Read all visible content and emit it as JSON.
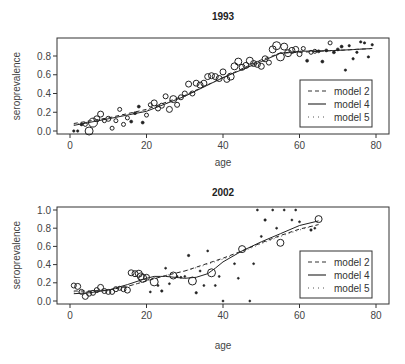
{
  "chart_data": [
    {
      "type": "scatter",
      "title": "1993",
      "xlabel": "age",
      "ylabel": "seroprevalence",
      "xlim": [
        -4,
        83
      ],
      "ylim": [
        -0.04,
        0.97
      ],
      "xticks": [
        0,
        20,
        40,
        60,
        80
      ],
      "yticks": [
        0.0,
        0.2,
        0.4,
        0.6,
        0.8
      ],
      "ytick_labels": [
        "0.0",
        "0.2",
        "0.4",
        "0.6",
        "0.8"
      ],
      "grid": false,
      "legend": {
        "position": "lower right",
        "entries": [
          {
            "label": "model 2",
            "style": "dashed"
          },
          {
            "label": "model 4",
            "style": "solid"
          },
          {
            "label": "model 5",
            "style": "dotted"
          }
        ]
      },
      "points": [
        {
          "x": 1,
          "y": 0.0,
          "r": 1.2
        },
        {
          "x": 2,
          "y": 0.0,
          "r": 1.2
        },
        {
          "x": 3,
          "y": 0.07,
          "r": 1.5
        },
        {
          "x": 4,
          "y": 0.07,
          "r": 2
        },
        {
          "x": 5,
          "y": 0.0,
          "r": 4
        },
        {
          "x": 6,
          "y": 0.09,
          "r": 4.5
        },
        {
          "x": 7,
          "y": 0.13,
          "r": 3
        },
        {
          "x": 8,
          "y": 0.18,
          "r": 3
        },
        {
          "x": 9,
          "y": 0.11,
          "r": 2
        },
        {
          "x": 10,
          "y": 0.13,
          "r": 2.5
        },
        {
          "x": 11,
          "y": 0.03,
          "r": 2
        },
        {
          "x": 12,
          "y": 0.11,
          "r": 2
        },
        {
          "x": 13,
          "y": 0.23,
          "r": 2
        },
        {
          "x": 14,
          "y": 0.07,
          "r": 2
        },
        {
          "x": 15,
          "y": 0.14,
          "r": 2
        },
        {
          "x": 16,
          "y": 0.1,
          "r": 1.5
        },
        {
          "x": 17,
          "y": 0.19,
          "r": 1.5
        },
        {
          "x": 18,
          "y": 0.26,
          "r": 1.5
        },
        {
          "x": 19,
          "y": 0.09,
          "r": 1.5
        },
        {
          "x": 20,
          "y": 0.17,
          "r": 2
        },
        {
          "x": 21,
          "y": 0.28,
          "r": 2
        },
        {
          "x": 22,
          "y": 0.3,
          "r": 3
        },
        {
          "x": 23,
          "y": 0.24,
          "r": 2.5
        },
        {
          "x": 24,
          "y": 0.27,
          "r": 2.5
        },
        {
          "x": 25,
          "y": 0.37,
          "r": 2.5
        },
        {
          "x": 26,
          "y": 0.23,
          "r": 3
        },
        {
          "x": 27,
          "y": 0.34,
          "r": 3.5
        },
        {
          "x": 28,
          "y": 0.28,
          "r": 2.5
        },
        {
          "x": 29,
          "y": 0.36,
          "r": 2.5
        },
        {
          "x": 30,
          "y": 0.4,
          "r": 2.5
        },
        {
          "x": 31,
          "y": 0.5,
          "r": 3
        },
        {
          "x": 32,
          "y": 0.4,
          "r": 2.5
        },
        {
          "x": 33,
          "y": 0.51,
          "r": 3
        },
        {
          "x": 34,
          "y": 0.49,
          "r": 3
        },
        {
          "x": 35,
          "y": 0.51,
          "r": 3
        },
        {
          "x": 36,
          "y": 0.58,
          "r": 3
        },
        {
          "x": 37,
          "y": 0.59,
          "r": 3
        },
        {
          "x": 38,
          "y": 0.58,
          "r": 3
        },
        {
          "x": 39,
          "y": 0.56,
          "r": 3
        },
        {
          "x": 40,
          "y": 0.63,
          "r": 3
        },
        {
          "x": 41,
          "y": 0.55,
          "r": 3
        },
        {
          "x": 42,
          "y": 0.58,
          "r": 3.5
        },
        {
          "x": 43,
          "y": 0.69,
          "r": 3.5
        },
        {
          "x": 44,
          "y": 0.74,
          "r": 3.5
        },
        {
          "x": 45,
          "y": 0.68,
          "r": 3
        },
        {
          "x": 46,
          "y": 0.7,
          "r": 3
        },
        {
          "x": 47,
          "y": 0.75,
          "r": 3.5
        },
        {
          "x": 48,
          "y": 0.72,
          "r": 3
        },
        {
          "x": 49,
          "y": 0.71,
          "r": 3
        },
        {
          "x": 50,
          "y": 0.69,
          "r": 3
        },
        {
          "x": 51,
          "y": 0.77,
          "r": 3
        },
        {
          "x": 52,
          "y": 0.73,
          "r": 2.5
        },
        {
          "x": 53,
          "y": 0.87,
          "r": 3.5
        },
        {
          "x": 54,
          "y": 0.91,
          "r": 4
        },
        {
          "x": 55,
          "y": 0.79,
          "r": 4
        },
        {
          "x": 56,
          "y": 0.9,
          "r": 3.5
        },
        {
          "x": 57,
          "y": 0.83,
          "r": 3.5
        },
        {
          "x": 58,
          "y": 0.86,
          "r": 3
        },
        {
          "x": 59,
          "y": 0.87,
          "r": 3
        },
        {
          "x": 60,
          "y": 0.82,
          "r": 2.5
        },
        {
          "x": 61,
          "y": 0.88,
          "r": 2
        },
        {
          "x": 62,
          "y": 0.75,
          "r": 1.5
        },
        {
          "x": 63,
          "y": 0.84,
          "r": 2
        },
        {
          "x": 64,
          "y": 0.85,
          "r": 2
        },
        {
          "x": 65,
          "y": 0.85,
          "r": 1.5
        },
        {
          "x": 66,
          "y": 0.74,
          "r": 1.5
        },
        {
          "x": 67,
          "y": 0.86,
          "r": 1.5
        },
        {
          "x": 68,
          "y": 0.94,
          "r": 2
        },
        {
          "x": 69,
          "y": 0.84,
          "r": 1.5
        },
        {
          "x": 70,
          "y": 0.87,
          "r": 1.5
        },
        {
          "x": 71,
          "y": 0.9,
          "r": 1.5
        },
        {
          "x": 72,
          "y": 0.65,
          "r": 1.2
        },
        {
          "x": 73,
          "y": 0.91,
          "r": 1.2
        },
        {
          "x": 74,
          "y": 0.77,
          "r": 1.2
        },
        {
          "x": 75,
          "y": 0.84,
          "r": 1.2
        },
        {
          "x": 76,
          "y": 0.95,
          "r": 1.2
        },
        {
          "x": 77,
          "y": 0.94,
          "r": 1.2
        },
        {
          "x": 78,
          "y": 0.79,
          "r": 1.2
        },
        {
          "x": 79,
          "y": 0.92,
          "r": 1.2
        }
      ],
      "series": [
        {
          "name": "model 2",
          "style": "dashed",
          "x": [
            1,
            10,
            20,
            30,
            40,
            50,
            55,
            60,
            70,
            79
          ],
          "y": [
            0.08,
            0.14,
            0.23,
            0.38,
            0.57,
            0.76,
            0.83,
            0.84,
            0.86,
            0.88
          ]
        },
        {
          "name": "model 4",
          "style": "solid",
          "x": [
            1,
            10,
            20,
            30,
            40,
            50,
            55,
            60,
            70,
            79
          ],
          "y": [
            0.06,
            0.13,
            0.21,
            0.37,
            0.57,
            0.74,
            0.83,
            0.85,
            0.86,
            0.88
          ]
        },
        {
          "name": "model 5",
          "style": "dotted",
          "x": [
            1,
            10,
            20,
            30,
            40,
            50,
            55,
            60,
            70,
            79
          ],
          "y": [
            0.07,
            0.13,
            0.22,
            0.37,
            0.57,
            0.75,
            0.83,
            0.85,
            0.86,
            0.88
          ]
        }
      ]
    },
    {
      "type": "scatter",
      "title": "2002",
      "xlabel": "age",
      "ylabel": "seroprevalence",
      "xlim": [
        -4,
        83
      ],
      "ylim": [
        -0.04,
        1.04
      ],
      "xticks": [
        0,
        20,
        40,
        60,
        80
      ],
      "yticks": [
        0.0,
        0.2,
        0.4,
        0.6,
        0.8,
        1.0
      ],
      "ytick_labels": [
        "0.0",
        "0.2",
        "0.4",
        "0.6",
        "0.8",
        "1.0"
      ],
      "grid": false,
      "legend": {
        "position": "lower right",
        "entries": [
          {
            "label": "model 2",
            "style": "dashed"
          },
          {
            "label": "model 4",
            "style": "solid"
          },
          {
            "label": "model 5",
            "style": "dotted"
          }
        ]
      },
      "points": [
        {
          "x": 1,
          "y": 0.17,
          "r": 2.5
        },
        {
          "x": 2,
          "y": 0.16,
          "r": 3
        },
        {
          "x": 3,
          "y": 0.1,
          "r": 2.5
        },
        {
          "x": 4,
          "y": 0.05,
          "r": 3
        },
        {
          "x": 5,
          "y": 0.08,
          "r": 2.5
        },
        {
          "x": 6,
          "y": 0.09,
          "r": 2.5
        },
        {
          "x": 7,
          "y": 0.12,
          "r": 2.5
        },
        {
          "x": 8,
          "y": 0.15,
          "r": 3
        },
        {
          "x": 9,
          "y": 0.11,
          "r": 2.5
        },
        {
          "x": 10,
          "y": 0.1,
          "r": 2.5
        },
        {
          "x": 11,
          "y": 0.1,
          "r": 2.5
        },
        {
          "x": 12,
          "y": 0.13,
          "r": 2.5
        },
        {
          "x": 13,
          "y": 0.14,
          "r": 2
        },
        {
          "x": 14,
          "y": 0.13,
          "r": 2.5
        },
        {
          "x": 15,
          "y": 0.12,
          "r": 3
        },
        {
          "x": 16,
          "y": 0.31,
          "r": 3
        },
        {
          "x": 17,
          "y": 0.3,
          "r": 3
        },
        {
          "x": 18,
          "y": 0.3,
          "r": 3.5
        },
        {
          "x": 18.5,
          "y": 0.27,
          "r": 3.5
        },
        {
          "x": 19,
          "y": 0.25,
          "r": 4
        },
        {
          "x": 20,
          "y": 0.26,
          "r": 3
        },
        {
          "x": 21,
          "y": 0.1,
          "r": 1
        },
        {
          "x": 22,
          "y": 0.21,
          "r": 4
        },
        {
          "x": 23,
          "y": 0.17,
          "r": 1
        },
        {
          "x": 24,
          "y": 0.11,
          "r": 1.2
        },
        {
          "x": 25,
          "y": 0.36,
          "r": 1
        },
        {
          "x": 26,
          "y": 0.19,
          "r": 1
        },
        {
          "x": 27,
          "y": 0.28,
          "r": 3.5
        },
        {
          "x": 28,
          "y": 0.27,
          "r": 1
        },
        {
          "x": 29,
          "y": 0.26,
          "r": 1
        },
        {
          "x": 30,
          "y": 0.27,
          "r": 1
        },
        {
          "x": 31,
          "y": 0.5,
          "r": 1.2
        },
        {
          "x": 32,
          "y": 0.22,
          "r": 4
        },
        {
          "x": 33,
          "y": 0.09,
          "r": 1.2
        },
        {
          "x": 34,
          "y": 0.33,
          "r": 1
        },
        {
          "x": 35,
          "y": 0.17,
          "r": 1
        },
        {
          "x": 36,
          "y": 0.55,
          "r": 1
        },
        {
          "x": 37,
          "y": 0.31,
          "r": 4
        },
        {
          "x": 38,
          "y": 0.17,
          "r": 1
        },
        {
          "x": 39,
          "y": 0.27,
          "r": 1
        },
        {
          "x": 40,
          "y": 0.0,
          "r": 1
        },
        {
          "x": 43,
          "y": 0.41,
          "r": 1
        },
        {
          "x": 44,
          "y": 0.25,
          "r": 1
        },
        {
          "x": 45,
          "y": 0.57,
          "r": 3.5
        },
        {
          "x": 47,
          "y": 0.0,
          "r": 1
        },
        {
          "x": 48,
          "y": 0.41,
          "r": 1
        },
        {
          "x": 49,
          "y": 1.0,
          "r": 1
        },
        {
          "x": 50,
          "y": 0.71,
          "r": 1
        },
        {
          "x": 51,
          "y": 0.89,
          "r": 1.2
        },
        {
          "x": 53,
          "y": 1.0,
          "r": 1
        },
        {
          "x": 54,
          "y": 0.8,
          "r": 1
        },
        {
          "x": 55,
          "y": 0.64,
          "r": 3.5
        },
        {
          "x": 56,
          "y": 1.0,
          "r": 1
        },
        {
          "x": 58,
          "y": 0.89,
          "r": 1
        },
        {
          "x": 59,
          "y": 1.0,
          "r": 1
        },
        {
          "x": 60,
          "y": 0.87,
          "r": 1
        },
        {
          "x": 63,
          "y": 0.78,
          "r": 1.2
        },
        {
          "x": 64,
          "y": 0.8,
          "r": 1
        },
        {
          "x": 65,
          "y": 0.9,
          "r": 3.5
        }
      ],
      "series": [
        {
          "name": "model 2",
          "style": "dashed",
          "x": [
            1,
            5,
            10,
            15,
            20,
            25,
            30,
            35,
            40,
            45,
            50,
            55,
            60,
            65
          ],
          "y": [
            0.11,
            0.11,
            0.12,
            0.16,
            0.22,
            0.28,
            0.33,
            0.4,
            0.47,
            0.55,
            0.64,
            0.72,
            0.79,
            0.84
          ]
        },
        {
          "name": "model 4",
          "style": "solid",
          "x": [
            1,
            5,
            10,
            15,
            20,
            22,
            25,
            30,
            33,
            36,
            38,
            40,
            45,
            50,
            55,
            60,
            65
          ],
          "y": [
            0.08,
            0.09,
            0.12,
            0.18,
            0.25,
            0.27,
            0.27,
            0.25,
            0.26,
            0.3,
            0.36,
            0.43,
            0.55,
            0.65,
            0.74,
            0.83,
            0.88
          ]
        },
        {
          "name": "model 5",
          "style": "dotted",
          "x": [
            1,
            5,
            10,
            15,
            20,
            25,
            30,
            35,
            40,
            45,
            50,
            55,
            60,
            65
          ],
          "y": [
            0.1,
            0.1,
            0.12,
            0.16,
            0.22,
            0.28,
            0.33,
            0.39,
            0.46,
            0.54,
            0.63,
            0.71,
            0.78,
            0.84
          ]
        }
      ]
    }
  ]
}
